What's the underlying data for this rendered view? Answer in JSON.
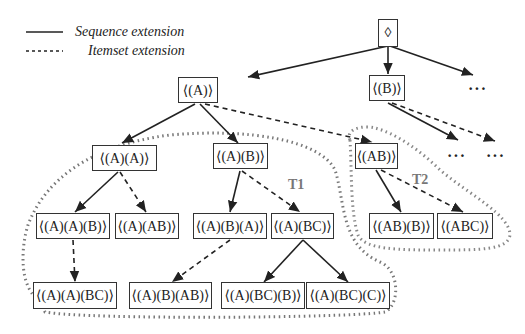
{
  "legend": {
    "sequence_label": "Sequence extension",
    "itemset_label": "Itemset extension"
  },
  "nodes": {
    "root": "⟨⟩",
    "A": "⟨(A)⟩",
    "B": "⟨(B)⟩",
    "AA": "⟨(A)(A)⟩",
    "AB": "⟨(A)(B)⟩",
    "ABitem": "⟨(AB)⟩",
    "AAB": "⟨(A)(A)(B)⟩",
    "A_AB": "⟨(A)(AB)⟩",
    "ABA": "⟨(A)(B)(A)⟩",
    "A_BC": "⟨(A)(BC)⟩",
    "ABB": "⟨(AB)(B)⟩",
    "ABC": "⟨(ABC)⟩",
    "AABC": "⟨(A)(A)(BC)⟩",
    "ABAB": "⟨(A)(B)(AB)⟩",
    "ABCB": "⟨(A)(BC)(B)⟩",
    "ABCC": "⟨(A)(BC)(C)⟩"
  },
  "subtree_labels": {
    "t1": "T1",
    "t2": "T2"
  },
  "ellipsis": "···",
  "root_symbol": "◊"
}
